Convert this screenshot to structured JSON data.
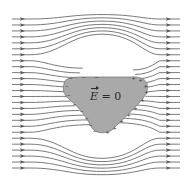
{
  "diagram": {
    "label": {
      "symbol": "E",
      "equals": " = 0",
      "position": {
        "x": 90,
        "y": 90
      }
    },
    "colors": {
      "background": "#ffffff",
      "field_line": "#6b6b6b",
      "arrow": "#5a5a5a",
      "conductor_fill": "#a9a9a9",
      "conductor_stroke": "#7a7a7a"
    },
    "field_lines": {
      "count": 26,
      "y_start": 19,
      "y_end": 168,
      "x_left": 12,
      "x_right": 180,
      "arrow_x_left": 22,
      "arrow_x_right": 168,
      "direction": "left-to-right"
    },
    "conductor": {
      "shape": "rounded triangle",
      "path": "M64,84 C64,78 72,77 84,77 L134,77 C146,77 150,84 146,94 C140,104 124,118 112,130 C106,134 96,134 92,128 C88,120 82,110 70,100 C62,94 63,88 64,84 Z",
      "center": {
        "x": 102,
        "y": 96
      },
      "negative_charges": [
        {
          "x": 66,
          "y": 86
        },
        {
          "x": 68,
          "y": 95
        },
        {
          "x": 74,
          "y": 104
        },
        {
          "x": 81,
          "y": 111
        },
        {
          "x": 86,
          "y": 118
        },
        {
          "x": 90,
          "y": 125
        },
        {
          "x": 94,
          "y": 131
        },
        {
          "x": 70,
          "y": 78
        },
        {
          "x": 83,
          "y": 77
        },
        {
          "x": 96,
          "y": 77
        }
      ],
      "positive_charges": [
        {
          "x": 133,
          "y": 78
        },
        {
          "x": 140,
          "y": 80
        },
        {
          "x": 145,
          "y": 86
        },
        {
          "x": 146,
          "y": 92
        },
        {
          "x": 142,
          "y": 100
        },
        {
          "x": 135,
          "y": 108
        },
        {
          "x": 128,
          "y": 115
        },
        {
          "x": 121,
          "y": 121
        },
        {
          "x": 114,
          "y": 128
        },
        {
          "x": 107,
          "y": 132
        }
      ]
    }
  }
}
